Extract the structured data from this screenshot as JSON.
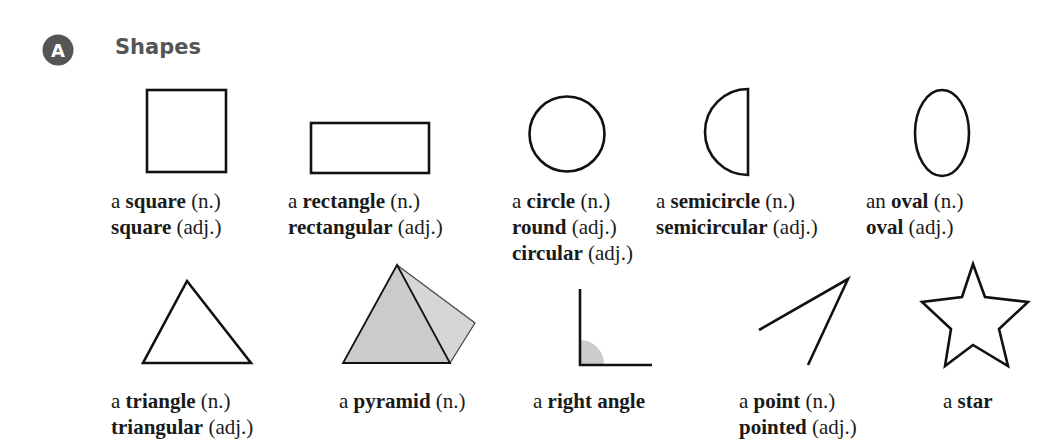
{
  "section": {
    "badge_letter": "A",
    "title": "Shapes",
    "badge_color": "#555555"
  },
  "items": [
    {
      "shape": "square",
      "lines": [
        {
          "pre": "a ",
          "bold": "square",
          "post": " (n.)"
        },
        {
          "pre": "",
          "bold": "square",
          "post": " (adj.)"
        }
      ]
    },
    {
      "shape": "rectangle",
      "lines": [
        {
          "pre": "a ",
          "bold": "rectangle",
          "post": " (n.)"
        },
        {
          "pre": "",
          "bold": "rectangular",
          "post": " (adj.)"
        }
      ]
    },
    {
      "shape": "circle",
      "lines": [
        {
          "pre": "a ",
          "bold": "circle",
          "post": " (n.)"
        },
        {
          "pre": "",
          "bold": "round",
          "post": " (adj.)"
        },
        {
          "pre": "",
          "bold": "circular",
          "post": " (adj.)"
        }
      ]
    },
    {
      "shape": "semicircle",
      "lines": [
        {
          "pre": "a ",
          "bold": "semicircle",
          "post": " (n.)"
        },
        {
          "pre": "",
          "bold": "semicircular",
          "post": " (adj.)"
        }
      ]
    },
    {
      "shape": "oval",
      "lines": [
        {
          "pre": "an ",
          "bold": "oval",
          "post": " (n.)"
        },
        {
          "pre": "",
          "bold": "oval",
          "post": " (adj.)"
        }
      ]
    },
    {
      "shape": "triangle",
      "lines": [
        {
          "pre": "a ",
          "bold": "triangle",
          "post": " (n.)"
        },
        {
          "pre": "",
          "bold": "triangular",
          "post": " (adj.)"
        }
      ]
    },
    {
      "shape": "pyramid",
      "lines": [
        {
          "pre": "a ",
          "bold": "pyramid",
          "post": " (n.)"
        }
      ]
    },
    {
      "shape": "right-angle",
      "lines": [
        {
          "pre": "a ",
          "bold": "right angle",
          "post": ""
        }
      ]
    },
    {
      "shape": "point",
      "lines": [
        {
          "pre": "a ",
          "bold": "point",
          "post": " (n.)"
        },
        {
          "pre": "",
          "bold": "pointed",
          "post": " (adj.)"
        }
      ]
    },
    {
      "shape": "star",
      "lines": [
        {
          "pre": "a ",
          "bold": "star",
          "post": ""
        }
      ]
    }
  ],
  "colors": {
    "stroke": "#111111",
    "fill_gray": "#cfcfcf",
    "fill_gray_light": "#dadada"
  }
}
